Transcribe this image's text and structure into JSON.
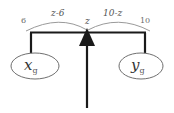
{
  "diagram": {
    "type": "flow-network-diagram",
    "background_color": "#ffffff",
    "line_color": "#1a1a1a",
    "arc_color": "#8a8a8a",
    "text_color": "#4a4a4a",
    "nodes": [
      {
        "id": "x",
        "base": "x",
        "subscript": "g",
        "label": "x_g",
        "cx": 35,
        "cy": 66,
        "rx": 24,
        "ry": 13
      },
      {
        "id": "y",
        "base": "y",
        "subscript": "g",
        "label": "y_g",
        "cx": 141,
        "cy": 66,
        "rx": 22,
        "ry": 13
      }
    ],
    "labels": {
      "left_capacity": "6",
      "left_arc": "z-6",
      "center_flow": "z",
      "right_arc": "10-z",
      "right_capacity": "10"
    },
    "arrow": {
      "name": "upward-flow-arrow",
      "direction": "up",
      "tip_y": 34,
      "tail_y": 108,
      "x": 87
    },
    "bar": {
      "name": "horizontal-bar",
      "x1": 30,
      "x2": 146,
      "y": 33
    }
  }
}
